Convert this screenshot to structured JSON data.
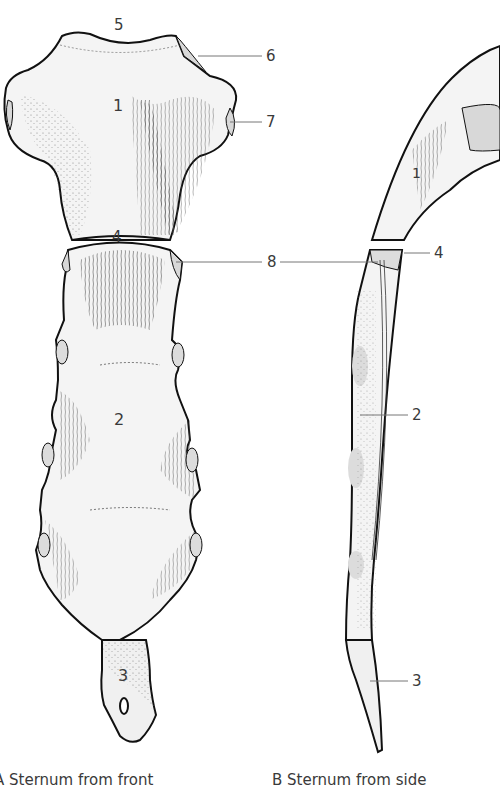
{
  "figure": {
    "subject": "Sternum",
    "views": [
      {
        "id": "A",
        "caption": "A  Sternum from front"
      },
      {
        "id": "B",
        "caption": "B  Sternum from side"
      }
    ]
  },
  "labels_front": {
    "manubrium_num": "1",
    "body_num": "2",
    "xiphoid_num": "3",
    "sternal_angle_num": "4",
    "jugular_notch_num": "5",
    "clavicular_notch_num": "6",
    "first_costal_notch_num": "7",
    "second_costal_notch_num": "8"
  },
  "labels_side": {
    "manubrium_num": "1",
    "sternal_angle_num": "4",
    "body_num": "2",
    "xiphoid_num": "3"
  },
  "colors": {
    "bone_fill": "#f2f2f2",
    "outline": "#111111",
    "cartilage": "#d8d8d8",
    "leader": "#777777",
    "text": "#3a3a3a"
  }
}
